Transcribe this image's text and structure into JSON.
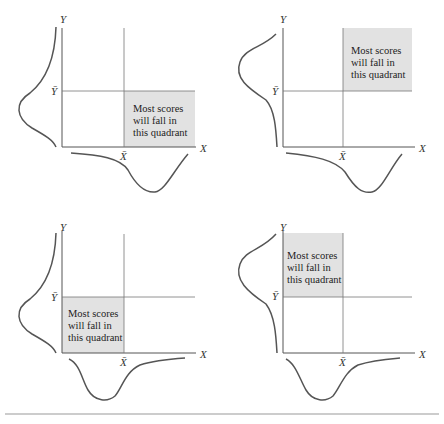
{
  "figure": {
    "panels": [
      {
        "id": "top-left",
        "shaded_quadrant": "lower-right",
        "text_lines": [
          "Most scores",
          "will fall in",
          "this quadrant"
        ],
        "x_label": "X",
        "y_label": "Y",
        "x_mean_label": "X̄",
        "y_mean_label": "Ȳ"
      },
      {
        "id": "top-right",
        "shaded_quadrant": "upper-right",
        "text_lines": [
          "Most scores",
          "will fall in",
          "this quadrant"
        ],
        "x_label": "X",
        "y_label": "Y",
        "x_mean_label": "X̄",
        "y_mean_label": "Ȳ"
      },
      {
        "id": "bottom-left",
        "shaded_quadrant": "lower-left",
        "text_lines": [
          "Most scores",
          "will fall in",
          "this quadrant"
        ],
        "x_label": "X",
        "y_label": "Y",
        "x_mean_label": "X̄",
        "y_mean_label": "Ȳ"
      },
      {
        "id": "bottom-right",
        "shaded_quadrant": "upper-left",
        "text_lines": [
          "Most scores",
          "will fall in",
          "this quadrant"
        ],
        "x_label": "X",
        "y_label": "Y",
        "x_mean_label": "X̄",
        "y_mean_label": "Ȳ"
      }
    ],
    "colors": {
      "shade": "#e2e2e2",
      "axis": "#555555"
    }
  }
}
